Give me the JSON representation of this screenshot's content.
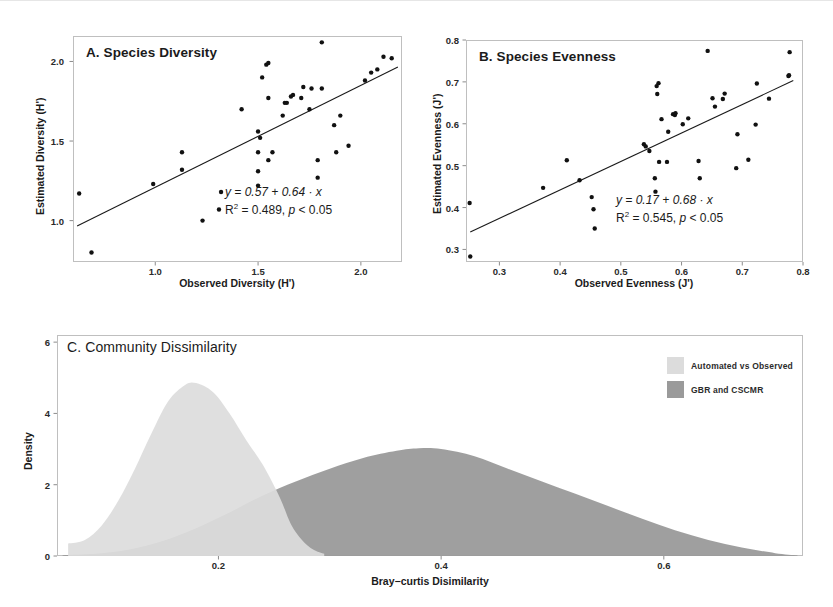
{
  "figure": {
    "background": "#ffffff",
    "point_color": "#111111",
    "line_color": "#1a1a1a",
    "frame_color": "#bfbfbf"
  },
  "panel_a": {
    "title": "A. Species Diversity",
    "xlabel": "Observed Diversity (H')",
    "ylabel": "Estimated Diversity (H')",
    "xticks": [
      "1.0",
      "1.5",
      "2.0"
    ],
    "yticks": [
      "1.0",
      "1.5",
      "2.0"
    ],
    "eq_line1": "y = 0.57 + 0.64 · x",
    "eq_r2_prefix": "R",
    "eq_r2_sup": "2",
    "eq_line2_rest": " = 0.489, ",
    "eq_p": "p",
    "eq_p_rest": " < 0.05"
  },
  "panel_b": {
    "title": "B. Species Evenness",
    "xlabel": "Observed Evenness (J')",
    "ylabel": "Estimated Evenness (J')",
    "xticks": [
      "0.3",
      "0.4",
      "0.5",
      "0.6",
      "0.7",
      "0.8"
    ],
    "yticks": [
      "0.3",
      "0.4",
      "0.5",
      "0.6",
      "0.7",
      "0.8"
    ],
    "eq_line1": "y = 0.17 + 0.68 · x",
    "eq_r2_prefix": "R",
    "eq_r2_sup": "2",
    "eq_line2_rest": " = 0.545, ",
    "eq_p": "p",
    "eq_p_rest": " < 0.05"
  },
  "panel_c": {
    "title": "C. Community Dissimilarity",
    "xlabel": "Bray−curtis Disimilarity",
    "ylabel": "Density",
    "xticks": [
      "0.2",
      "0.4",
      "0.6"
    ],
    "yticks": [
      "0",
      "2",
      "4",
      "6"
    ],
    "legend": [
      {
        "label": "Automated vs Observed",
        "color": "#dcdcdc"
      },
      {
        "label": "GBR and CSCMR",
        "color": "#9a9a9a"
      }
    ]
  },
  "chart_data": [
    {
      "type": "scatter",
      "panel": "A",
      "title": "A. Species Diversity",
      "xlabel": "Observed Diversity (H')",
      "ylabel": "Estimated Diversity (H')",
      "xlim": [
        0.6,
        2.2
      ],
      "ylim": [
        0.74,
        2.16
      ],
      "xticks": [
        1.0,
        1.5,
        2.0
      ],
      "yticks": [
        1.0,
        1.5,
        2.0
      ],
      "grid": false,
      "points": [
        [
          0.63,
          1.17
        ],
        [
          0.69,
          0.8
        ],
        [
          0.99,
          1.23
        ],
        [
          1.13,
          1.32
        ],
        [
          1.13,
          1.43
        ],
        [
          1.23,
          1.0
        ],
        [
          1.31,
          1.07
        ],
        [
          1.32,
          1.18
        ],
        [
          1.42,
          1.7
        ],
        [
          1.5,
          1.22
        ],
        [
          1.5,
          1.31
        ],
        [
          1.5,
          1.43
        ],
        [
          1.5,
          1.56
        ],
        [
          1.51,
          1.52
        ],
        [
          1.52,
          1.9
        ],
        [
          1.54,
          1.98
        ],
        [
          1.55,
          1.99
        ],
        [
          1.55,
          1.77
        ],
        [
          1.55,
          1.38
        ],
        [
          1.57,
          1.43
        ],
        [
          1.62,
          1.66
        ],
        [
          1.63,
          1.74
        ],
        [
          1.64,
          1.74
        ],
        [
          1.66,
          1.78
        ],
        [
          1.67,
          1.79
        ],
        [
          1.71,
          1.77
        ],
        [
          1.72,
          1.84
        ],
        [
          1.75,
          1.7
        ],
        [
          1.76,
          1.83
        ],
        [
          1.79,
          1.38
        ],
        [
          1.79,
          1.27
        ],
        [
          1.81,
          2.12
        ],
        [
          1.81,
          1.83
        ],
        [
          1.87,
          1.6
        ],
        [
          1.88,
          1.43
        ],
        [
          1.9,
          1.66
        ],
        [
          1.94,
          1.47
        ],
        [
          2.02,
          1.88
        ],
        [
          2.05,
          1.93
        ],
        [
          2.08,
          1.95
        ],
        [
          2.11,
          2.03
        ],
        [
          2.15,
          2.02
        ]
      ],
      "fit_line": {
        "intercept": 0.57,
        "slope": 0.64,
        "x_from": 0.62,
        "x_to": 2.18
      },
      "annotations": [
        "y = 0.57 + 0.64 · x",
        "R2 = 0.489, p < 0.05"
      ]
    },
    {
      "type": "scatter",
      "panel": "B",
      "title": "B. Species Evenness",
      "xlabel": "Observed Evenness (J')",
      "ylabel": "Estimated Evenness (J')",
      "xlim": [
        0.245,
        0.8
      ],
      "ylim": [
        0.27,
        0.8
      ],
      "xticks": [
        0.3,
        0.4,
        0.5,
        0.6,
        0.7,
        0.8
      ],
      "yticks": [
        0.3,
        0.4,
        0.5,
        0.6,
        0.7,
        0.8
      ],
      "grid": false,
      "points": [
        [
          0.251,
          0.411
        ],
        [
          0.252,
          0.283
        ],
        [
          0.372,
          0.447
        ],
        [
          0.411,
          0.513
        ],
        [
          0.432,
          0.465
        ],
        [
          0.452,
          0.425
        ],
        [
          0.455,
          0.396
        ],
        [
          0.457,
          0.35
        ],
        [
          0.538,
          0.551
        ],
        [
          0.541,
          0.546
        ],
        [
          0.547,
          0.535
        ],
        [
          0.556,
          0.47
        ],
        [
          0.557,
          0.438
        ],
        [
          0.559,
          0.69
        ],
        [
          0.56,
          0.671
        ],
        [
          0.562,
          0.697
        ],
        [
          0.563,
          0.509
        ],
        [
          0.567,
          0.611
        ],
        [
          0.576,
          0.509
        ],
        [
          0.578,
          0.581
        ],
        [
          0.586,
          0.623
        ],
        [
          0.589,
          0.621
        ],
        [
          0.59,
          0.625
        ],
        [
          0.602,
          0.599
        ],
        [
          0.611,
          0.613
        ],
        [
          0.628,
          0.511
        ],
        [
          0.63,
          0.47
        ],
        [
          0.643,
          0.774
        ],
        [
          0.651,
          0.661
        ],
        [
          0.655,
          0.641
        ],
        [
          0.668,
          0.659
        ],
        [
          0.671,
          0.672
        ],
        [
          0.69,
          0.494
        ],
        [
          0.692,
          0.575
        ],
        [
          0.71,
          0.514
        ],
        [
          0.722,
          0.598
        ],
        [
          0.724,
          0.696
        ],
        [
          0.744,
          0.66
        ],
        [
          0.776,
          0.714
        ],
        [
          0.777,
          0.716
        ],
        [
          0.778,
          0.771
        ]
      ],
      "fit_line": {
        "intercept": 0.17,
        "slope": 0.68,
        "x_from": 0.252,
        "x_to": 0.784
      },
      "annotations": [
        "y = 0.17 + 0.68 · x",
        "R2 = 0.545, p < 0.05"
      ]
    },
    {
      "type": "area",
      "panel": "C",
      "title": "C. Community Dissimilarity",
      "xlabel": "Bray−curtis Disimilarity",
      "ylabel": "Density",
      "xlim": [
        0.055,
        0.725
      ],
      "ylim": [
        0,
        6.2
      ],
      "xticks": [
        0.2,
        0.4,
        0.6
      ],
      "yticks": [
        0,
        2,
        4,
        6
      ],
      "grid": false,
      "legend_position": "top-right",
      "series": [
        {
          "name": "Automated vs Observed",
          "color": "#dcdcdc",
          "x": [
            0.065,
            0.08,
            0.095,
            0.11,
            0.125,
            0.14,
            0.155,
            0.17,
            0.18,
            0.195,
            0.21,
            0.225,
            0.24,
            0.255,
            0.265,
            0.275,
            0.285,
            0.295
          ],
          "y": [
            0.35,
            0.45,
            0.85,
            1.55,
            2.45,
            3.45,
            4.35,
            4.8,
            4.85,
            4.6,
            4.0,
            3.25,
            2.55,
            1.65,
            0.9,
            0.45,
            0.18,
            0.06
          ]
        },
        {
          "name": "GBR and CSCMR",
          "color": "#9a9a9a",
          "x": [
            0.06,
            0.09,
            0.12,
            0.15,
            0.18,
            0.21,
            0.24,
            0.27,
            0.3,
            0.33,
            0.36,
            0.38,
            0.4,
            0.43,
            0.46,
            0.49,
            0.52,
            0.55,
            0.58,
            0.61,
            0.64,
            0.67,
            0.7,
            0.72
          ],
          "y": [
            0.02,
            0.06,
            0.18,
            0.42,
            0.78,
            1.22,
            1.7,
            2.1,
            2.45,
            2.75,
            2.95,
            3.02,
            3.0,
            2.8,
            2.45,
            2.1,
            1.75,
            1.4,
            1.05,
            0.72,
            0.45,
            0.24,
            0.08,
            0.02
          ]
        }
      ]
    }
  ]
}
